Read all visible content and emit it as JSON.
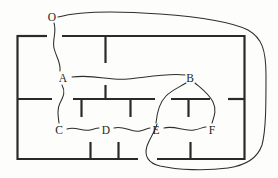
{
  "figure": {
    "width": 278,
    "height": 178,
    "background_color": "#fdfdfb",
    "wall_color": "#2a2a28",
    "edge_color": "#2e2e2c"
  },
  "nodes": [
    {
      "id": "O",
      "label": "O",
      "x": 52,
      "y": 17,
      "role": "outside-region"
    },
    {
      "id": "A",
      "label": "A",
      "x": 63,
      "y": 78,
      "role": "room"
    },
    {
      "id": "B",
      "label": "B",
      "x": 190,
      "y": 78,
      "role": "room"
    },
    {
      "id": "C",
      "label": "C",
      "x": 59,
      "y": 130,
      "role": "room"
    },
    {
      "id": "D",
      "label": "D",
      "x": 106,
      "y": 130,
      "role": "room"
    },
    {
      "id": "E",
      "label": "E",
      "x": 156,
      "y": 130,
      "role": "room"
    },
    {
      "id": "F",
      "label": "F",
      "x": 212,
      "y": 130,
      "role": "room"
    }
  ],
  "edges": [
    {
      "id": "O-A-top",
      "from": "O",
      "to": "A",
      "via": "top-wall-door"
    },
    {
      "id": "A-B",
      "from": "A",
      "to": "B",
      "via": "interior-wall-door"
    },
    {
      "id": "A-C",
      "from": "A",
      "to": "C",
      "via": "middle-wall-door"
    },
    {
      "id": "C-D",
      "from": "C",
      "to": "D",
      "via": "vertical-wall-door"
    },
    {
      "id": "D-E",
      "from": "D",
      "to": "E",
      "via": "vertical-wall-door"
    },
    {
      "id": "E-F",
      "from": "E",
      "to": "F",
      "via": "vertical-wall-door"
    },
    {
      "id": "B-E",
      "from": "B",
      "to": "E",
      "via": "middle-wall-door"
    },
    {
      "id": "B-F",
      "from": "B",
      "to": "F",
      "via": "middle-wall-door"
    },
    {
      "id": "O-E-bottom",
      "from": "O",
      "to": "E",
      "via": "outside-loop-bottom-door"
    }
  ],
  "walls": {
    "outer_rect": {
      "left": 17,
      "top": 35,
      "right": 245,
      "bottom": 160
    },
    "doors": [
      {
        "id": "top-door",
        "wall": "top",
        "from_x": 47,
        "to_x": 62
      },
      {
        "id": "middle-left-door",
        "wall": "middle",
        "from_x": 52,
        "to_x": 73
      },
      {
        "id": "middle-center-door",
        "wall": "middle",
        "from_x": 155,
        "to_x": 171
      },
      {
        "id": "middle-right-door",
        "wall": "middle",
        "from_x": 210,
        "to_x": 228
      },
      {
        "id": "bottom-door",
        "wall": "bottom",
        "from_x": 138,
        "to_x": 157
      }
    ]
  }
}
